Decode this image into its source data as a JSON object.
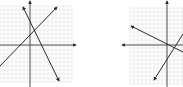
{
  "figure": {
    "colors": {
      "background": "#ffffff",
      "grid": "#e2e2e2",
      "axis": "#3a3a3a",
      "line": "#2a2a2a"
    },
    "graphs": [
      {
        "id": "left",
        "grid": {
          "x0": 0,
          "y0": 6,
          "x1": 72,
          "y1": 82,
          "step": 4
        },
        "y_axis": {
          "x": 30,
          "y_top": 0,
          "y_bottom": 87
        },
        "x_axis": {
          "y": 45,
          "x_left": 0,
          "x_right": 76,
          "arrow": "right"
        },
        "lines": [
          {
            "name": "increasing-line",
            "x1": 0,
            "y1": 66,
            "x2": 57,
            "y2": 7,
            "arrow_end": true
          },
          {
            "name": "decreasing-line",
            "x1": 23,
            "y1": 7,
            "x2": 59,
            "y2": 81,
            "arrow_start": true,
            "arrow_end": true
          }
        ]
      },
      {
        "id": "right",
        "grid": {
          "x0": 130,
          "y0": 8,
          "x1": 183,
          "y1": 84,
          "step": 4
        },
        "y_axis": {
          "x": 167,
          "y_top": 0,
          "y_bottom": 87
        },
        "x_axis": {
          "y": 45,
          "x_left": 122,
          "x_right": 183,
          "arrow": "left"
        },
        "lines": [
          {
            "name": "decreasing-line",
            "x1": 131,
            "y1": 26,
            "x2": 183,
            "y2": 52,
            "arrow_start": true
          },
          {
            "name": "increasing-line",
            "x1": 154,
            "y1": 80,
            "x2": 183,
            "y2": 34,
            "arrow_start": true
          }
        ]
      }
    ]
  }
}
